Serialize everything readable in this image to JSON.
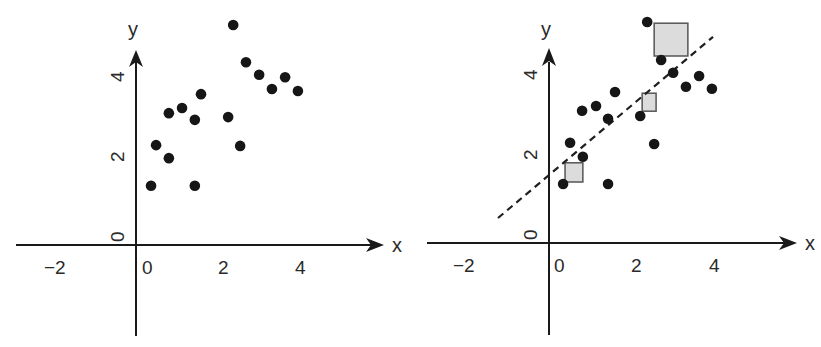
{
  "chart_data": [
    {
      "type": "scatter",
      "panel": "left",
      "title": "",
      "xlabel": "x",
      "ylabel": "y",
      "xticks": [
        "-2",
        "0",
        "2",
        "4"
      ],
      "yticks": [
        "0",
        "2",
        "4"
      ],
      "xlim": [
        -3.2,
        5.5
      ],
      "ylim": [
        -2.3,
        5.4
      ],
      "grid": false,
      "legend": null,
      "points": [
        {
          "x": 0.13,
          "y": 1.22
        },
        {
          "x": 0.26,
          "y": 2.25
        },
        {
          "x": 0.59,
          "y": 1.92
        },
        {
          "x": 0.59,
          "y": 3.06
        },
        {
          "x": 0.93,
          "y": 3.19
        },
        {
          "x": 1.26,
          "y": 2.89
        },
        {
          "x": 1.42,
          "y": 3.54
        },
        {
          "x": 1.26,
          "y": 1.22
        },
        {
          "x": 2.12,
          "y": 2.96
        },
        {
          "x": 2.25,
          "y": 5.29
        },
        {
          "x": 2.43,
          "y": 2.23
        },
        {
          "x": 2.58,
          "y": 4.35
        },
        {
          "x": 2.92,
          "y": 4.03
        },
        {
          "x": 3.25,
          "y": 3.67
        },
        {
          "x": 3.59,
          "y": 3.97
        },
        {
          "x": 3.92,
          "y": 3.62
        }
      ]
    },
    {
      "type": "scatter",
      "panel": "right",
      "title": "",
      "xlabel": "x",
      "ylabel": "y",
      "xticks": [
        "-2",
        "0",
        "2",
        "4"
      ],
      "yticks": [
        "0",
        "2",
        "4"
      ],
      "xlim": [
        -3.2,
        5.5
      ],
      "ylim": [
        -2.3,
        5.4
      ],
      "grid": false,
      "legend": null,
      "points": [
        {
          "x": 0.08,
          "y": 1.25
        },
        {
          "x": 0.26,
          "y": 2.28
        },
        {
          "x": 0.59,
          "y": 1.93
        },
        {
          "x": 0.57,
          "y": 3.08
        },
        {
          "x": 0.93,
          "y": 3.2
        },
        {
          "x": 1.24,
          "y": 2.88
        },
        {
          "x": 1.42,
          "y": 3.55
        },
        {
          "x": 1.24,
          "y": 1.25
        },
        {
          "x": 2.07,
          "y": 2.95
        },
        {
          "x": 2.25,
          "y": 5.3
        },
        {
          "x": 2.43,
          "y": 2.25
        },
        {
          "x": 2.61,
          "y": 4.35
        },
        {
          "x": 2.92,
          "y": 4.03
        },
        {
          "x": 3.25,
          "y": 3.68
        },
        {
          "x": 3.59,
          "y": 3.95
        },
        {
          "x": 3.92,
          "y": 3.63
        }
      ],
      "fit_line": {
        "style": "dashed",
        "x1": -1.6,
        "y1": 0.4,
        "x2": 3.95,
        "y2": 4.93,
        "slope": 0.82,
        "intercept": 1.7
      },
      "squared_residuals": [
        {
          "label": "small",
          "x": 0.13,
          "y": 1.3,
          "x2": 0.59,
          "y2": 1.78
        },
        {
          "label": "medium",
          "x": 2.12,
          "y": 3.07,
          "x2": 2.48,
          "y2": 3.52
        },
        {
          "label": "large",
          "x": 2.43,
          "y": 4.45,
          "x2": 3.3,
          "y2": 5.27
        }
      ]
    }
  ],
  "panels": {
    "left": {
      "x_axis_label": "x",
      "y_axis_label": "y",
      "x_tick_labels": [
        "−2",
        "0",
        "2",
        "4"
      ],
      "y_tick_labels": [
        "0",
        "2",
        "4"
      ]
    },
    "right": {
      "x_axis_label": "x",
      "y_axis_label": "y",
      "x_tick_labels": [
        "−2",
        "0",
        "2",
        "4"
      ],
      "y_tick_labels": [
        "0",
        "2",
        "4"
      ]
    }
  },
  "colors": {
    "ink": "#161616",
    "square_fill": "#dcdcdc",
    "square_stroke": "#555555",
    "background": "#ffffff"
  }
}
